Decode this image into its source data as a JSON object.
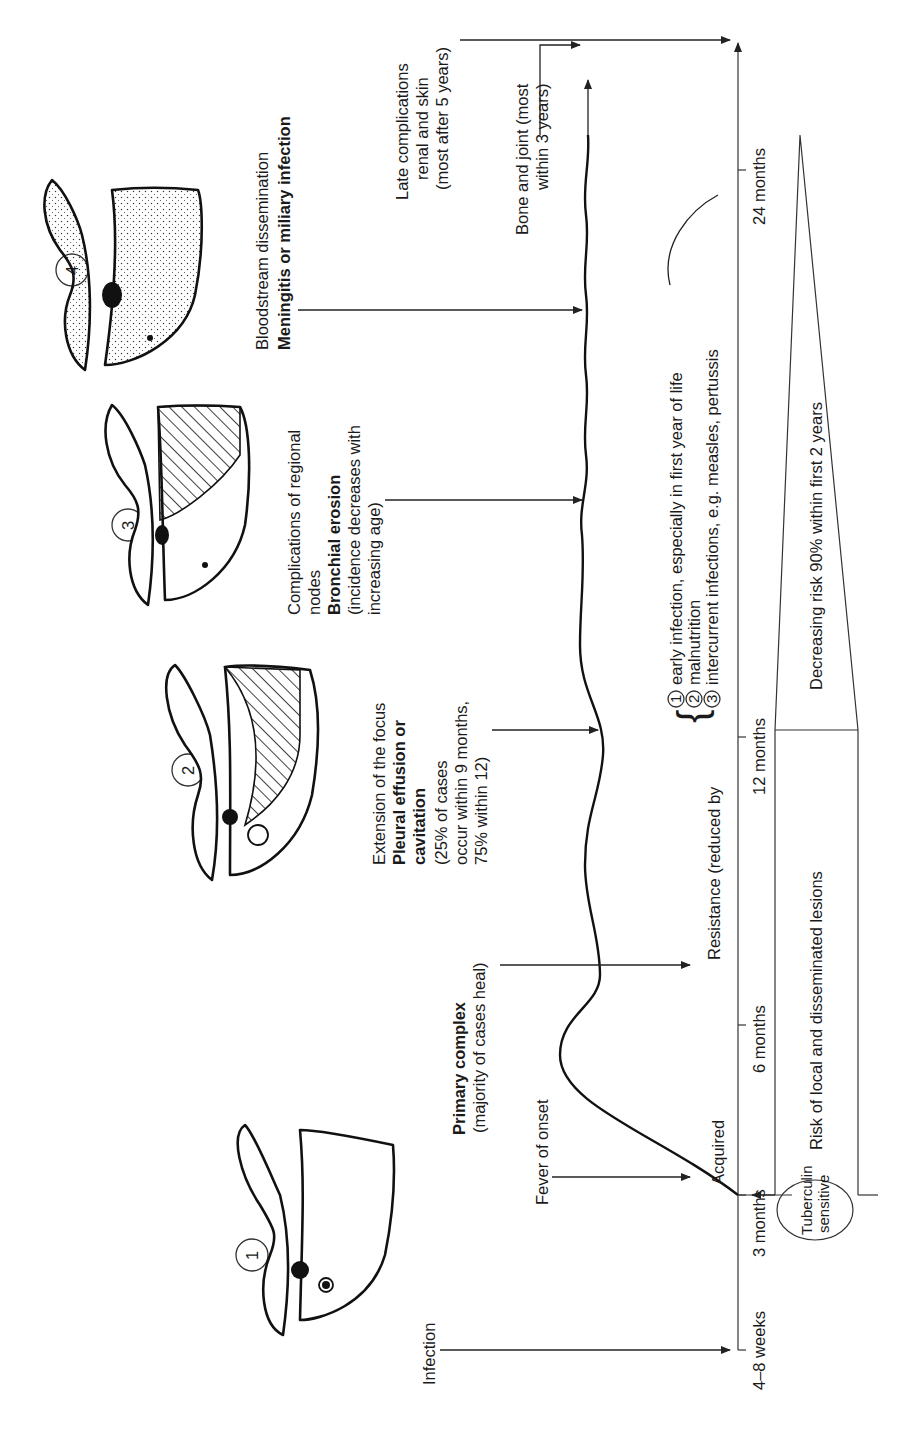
{
  "diagram": {
    "orientation": "rotated 90 degrees counter-clockwise (timeline runs bottom to top)",
    "stages": [
      {
        "number": "1",
        "heading_bold": "Primary complex",
        "lines": [
          "(majority of cases heal)"
        ]
      },
      {
        "number": "2",
        "heading_plain": "Extension of the focus",
        "heading_bold_lines": [
          "Pleural effusion or",
          "cavitation"
        ],
        "lines": [
          "(25% of cases",
          "occur within 9 months,",
          "75% within 12)"
        ]
      },
      {
        "number": "3",
        "heading_plain_lines": [
          "Complications of regional",
          "nodes"
        ],
        "heading_bold": "Bronchial erosion",
        "lines": [
          "(incidence decreases with",
          "increasing age)"
        ]
      },
      {
        "number": "4",
        "heading_plain": "Bloodstream dissemination",
        "heading_bold": "Meningitis or miliary infection"
      }
    ],
    "events": {
      "infection": "Infection",
      "fever": "Fever of onset",
      "bone_joint": [
        "Bone and joint (most",
        "within 3 years)"
      ],
      "late_complications": [
        "Late complications",
        "renal and skin",
        "(most after 5 years)"
      ]
    },
    "curve_labels": {
      "acquired": "Acquired",
      "resistance": "Resistance (reduced by",
      "factors": [
        {
          "num": "1",
          "text": "early infection, especially in first year of life"
        },
        {
          "num": "2",
          "text": "malnutrition"
        },
        {
          "num": "3",
          "text": "intercurrent infections, e.g. measles, pertussis"
        }
      ]
    },
    "timeline": {
      "ticks": [
        "4–8 weeks",
        "3 months",
        "6 months",
        "12 months",
        "24 months"
      ]
    },
    "bottom_band": {
      "tuberculin": [
        "Tuberculin",
        "sensitive"
      ],
      "risk_label": "Risk of local and disseminated lesions",
      "decreasing_label": "Decreasing risk 90% within first 2 years"
    }
  }
}
